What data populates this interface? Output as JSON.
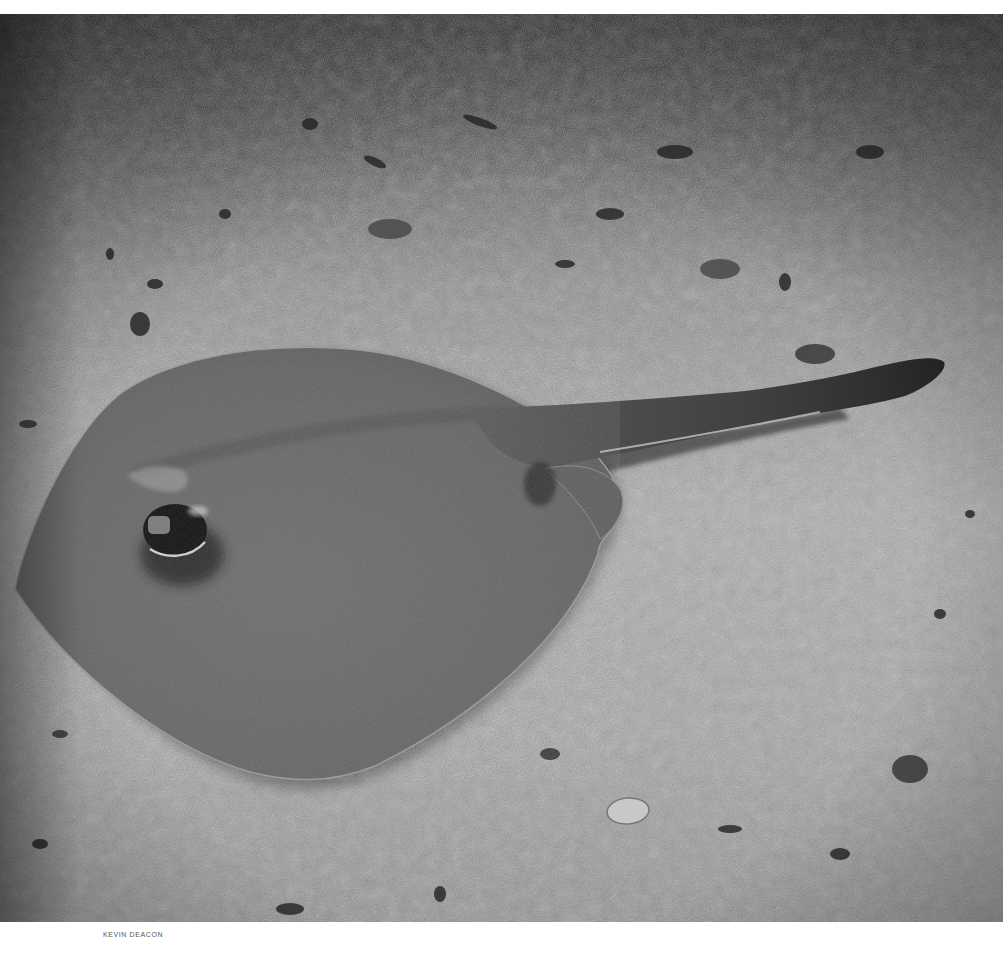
{
  "photo": {
    "subject": "stingray resting on sandy seabed",
    "tone": "grayscale",
    "colors": {
      "sand_light": "#b4b4b4",
      "sand_mid": "#8e8e8e",
      "sand_dark": "#2e2e2e",
      "ray_body": "#6a6a6a",
      "ray_shadow": "#1e1e1e",
      "tail": "#3a3a3a"
    }
  },
  "credit": {
    "text": "KEVIN DEACON"
  }
}
